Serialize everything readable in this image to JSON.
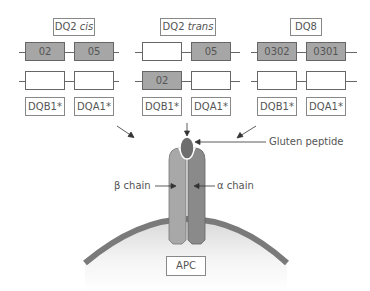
{
  "groups": [
    {
      "title": "DQ2",
      "title_italic": "cis",
      "row1": [
        {
          "value": "02",
          "filled": true
        },
        {
          "value": "05",
          "filled": true
        }
      ],
      "row2": [
        {
          "value": "",
          "filled": false
        },
        {
          "value": "",
          "filled": false
        }
      ],
      "labels": [
        "DQB1*",
        "DQA1*"
      ]
    },
    {
      "title": "DQ2",
      "title_italic": "trans",
      "row1": [
        {
          "value": "",
          "filled": false
        },
        {
          "value": "05",
          "filled": true
        }
      ],
      "row2": [
        {
          "value": "02",
          "filled": true
        },
        {
          "value": "",
          "filled": false
        }
      ],
      "labels": [
        "DQB1*",
        "DQA1*"
      ]
    },
    {
      "title": "DQ8",
      "title_italic": "",
      "row1": [
        {
          "value": "0302",
          "filled": true
        },
        {
          "value": "0301",
          "filled": true
        }
      ],
      "row2": [
        {
          "value": "",
          "filled": false
        },
        {
          "value": "",
          "filled": false
        }
      ],
      "labels": [
        "DQB1*",
        "DQA1*"
      ]
    }
  ],
  "annotations": {
    "peptide": "Gluten peptide",
    "beta_chain": "β chain",
    "alpha_chain": "α chain",
    "cell": "APC"
  },
  "colors": {
    "filled_gene": "#a6a6a6",
    "beta_chain": "#a8a8a8",
    "alpha_chain": "#8a8a8a",
    "peptide": "#6e6e6e",
    "membrane": "#7a7a7a"
  }
}
